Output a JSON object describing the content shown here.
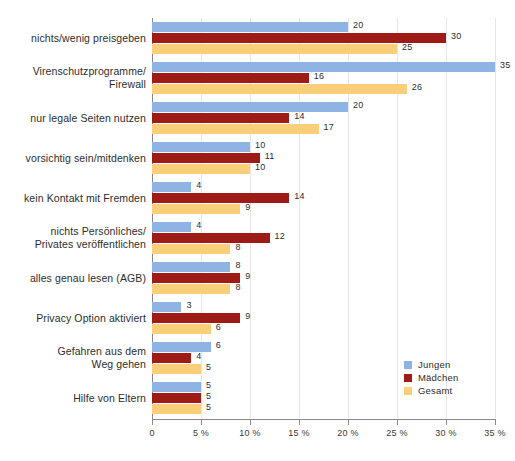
{
  "chart_data": {
    "type": "bar",
    "orientation": "horizontal",
    "title": "",
    "subtitle": "",
    "xlabel": "",
    "ylabel": "",
    "xlim": [
      0,
      35
    ],
    "xtick_values": [
      0,
      5,
      10,
      15,
      20,
      25,
      30,
      35
    ],
    "xtick_labels": [
      "0",
      "5 %",
      "10 %",
      "15 %",
      "20 %",
      "25 %",
      "30 %",
      "35 %"
    ],
    "grid": "vertical",
    "legend_position": "bottom-right",
    "categories": [
      "nichts/wenig preisgeben",
      "Virenschutzprogramme/\nFirewall",
      "nur legale Seiten nutzen",
      "vorsichtig sein/mitdenken",
      "kein Kontakt mit Fremden",
      "nichts Persönliches/\nPrivates veröffentlichen",
      "alles genau lesen (AGB)",
      "Privacy Option aktiviert",
      "Gefahren aus dem\nWeg gehen",
      "Hilfe von Eltern"
    ],
    "series": [
      {
        "name": "Jungen",
        "color": "#8DB4E2",
        "values": [
          20,
          35,
          20,
          10,
          4,
          4,
          8,
          3,
          6,
          5
        ]
      },
      {
        "name": "Mädchen",
        "color": "#9E1B18",
        "values": [
          30,
          16,
          14,
          11,
          14,
          12,
          9,
          9,
          4,
          5
        ]
      },
      {
        "name": "Gesamt",
        "color": "#FBCE7B",
        "values": [
          25,
          26,
          17,
          10,
          9,
          8,
          8,
          6,
          5,
          5
        ]
      }
    ],
    "value_labels": [
      [
        "20",
        "30",
        "25"
      ],
      [
        "35",
        "16",
        "26"
      ],
      [
        "20",
        "14",
        "17"
      ],
      [
        "10",
        "11",
        "10"
      ],
      [
        "4",
        "14",
        "9"
      ],
      [
        "4",
        "12",
        "8"
      ],
      [
        "8",
        "9",
        "8"
      ],
      [
        "3",
        "9",
        "6"
      ],
      [
        "6",
        "4",
        "5"
      ],
      [
        "5",
        "5",
        "5"
      ]
    ]
  },
  "legend": {
    "items": [
      {
        "label": "Jungen",
        "color": "#8DB4E2"
      },
      {
        "label": "Mädchen",
        "color": "#9E1B18"
      },
      {
        "label": "Gesamt",
        "color": "#FBCE7B"
      }
    ]
  },
  "colors": {
    "jungen": "#8DB4E2",
    "maedchen": "#9E1B18",
    "gesamt": "#FBCE7B",
    "axis": "#8a8a8a",
    "grid": "#e6e6e6",
    "text": "#2d2d2d",
    "background": "#ffffff"
  }
}
